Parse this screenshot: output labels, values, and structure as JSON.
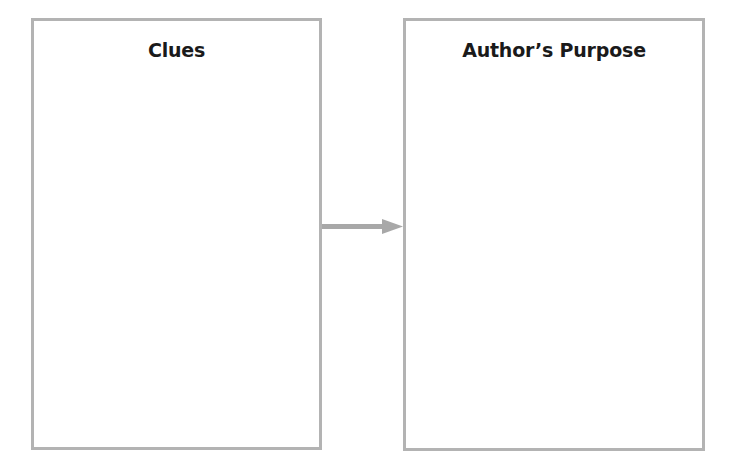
{
  "diagram": {
    "left_box": {
      "title": "Clues"
    },
    "right_box": {
      "title": "Author’s Purpose"
    },
    "connector": {
      "direction": "left-to-right",
      "color": "#a8a8a8"
    },
    "border_color": "#b3b3b3"
  }
}
